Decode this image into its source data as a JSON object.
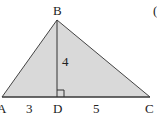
{
  "diagram": {
    "type": "triangle-with-altitude",
    "fill_color": "#d9d9d9",
    "stroke_color": "#333333",
    "vertices": {
      "A": {
        "label": "A",
        "x": 2,
        "y": 97
      },
      "B": {
        "label": "B",
        "x": 57,
        "y": 20
      },
      "C": {
        "label": "C",
        "x": 150,
        "y": 97
      },
      "D": {
        "label": "D",
        "x": 57,
        "y": 97
      }
    },
    "segments": [
      {
        "from": "A",
        "to": "D",
        "length_label": "3"
      },
      {
        "from": "D",
        "to": "C",
        "length_label": "5"
      },
      {
        "from": "B",
        "to": "D",
        "length_label": "4"
      }
    ],
    "right_angle_at": "D",
    "labels": {
      "A": "A",
      "B": "B",
      "C": "C",
      "D": "D",
      "AD": "3",
      "DC": "5",
      "BD": "4"
    },
    "edge_mark": "("
  }
}
